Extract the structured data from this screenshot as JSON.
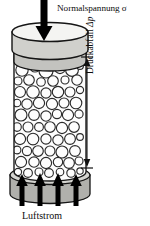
{
  "figure": {
    "labels": {
      "normal_stress": "Normalspannung σ",
      "pressure_drop_text": "Druckabfall ",
      "pressure_drop_symbol": "Δp",
      "airflow": "Luftstrom"
    },
    "colors": {
      "outline": "#1a1a1a",
      "arrow_fill": "#000000",
      "cap_face": "#f2f2f0",
      "cap_side": "#cfcfcb",
      "plate_side": "#b5b5b0",
      "base_disk": "#b0b0ac",
      "base_disk_top": "#d6d6d2",
      "column_body": "#fbfbfb",
      "particle_fill": "#fdfdfd",
      "particle_stroke": "#2b2b2b",
      "background": "#ffffff"
    },
    "geometry": {
      "column_left": 14,
      "column_right": 86,
      "column_top": 33,
      "column_bottom": 180,
      "dimension_line_x": 87,
      "dimension_top_y": 57,
      "dimension_bottom_y": 168
    },
    "icons": {
      "load_arrow": "arrow-down-icon",
      "airflow_arrows": "arrow-up-icon",
      "dimension_arrow": "double-headed-arrow-icon"
    },
    "airflow_arrow_count": 4,
    "particles": [
      {
        "cx": 22,
        "cy": 70,
        "r": 6.2
      },
      {
        "cx": 35,
        "cy": 67,
        "r": 5.0
      },
      {
        "cx": 46,
        "cy": 71,
        "r": 7.0
      },
      {
        "cx": 60,
        "cy": 68,
        "r": 5.6
      },
      {
        "cx": 72,
        "cy": 70,
        "r": 6.4
      },
      {
        "cx": 80,
        "cy": 66,
        "r": 3.4
      },
      {
        "cx": 18,
        "cy": 81,
        "r": 4.0
      },
      {
        "cx": 29,
        "cy": 80,
        "r": 5.3
      },
      {
        "cx": 41,
        "cy": 82,
        "r": 4.3
      },
      {
        "cx": 53,
        "cy": 81,
        "r": 5.3
      },
      {
        "cx": 65,
        "cy": 80,
        "r": 4.0
      },
      {
        "cx": 77,
        "cy": 80,
        "r": 5.2
      },
      {
        "cx": 20,
        "cy": 92,
        "r": 5.5
      },
      {
        "cx": 33,
        "cy": 92,
        "r": 6.3
      },
      {
        "cx": 46,
        "cy": 93,
        "r": 5.1
      },
      {
        "cx": 58,
        "cy": 92,
        "r": 5.7
      },
      {
        "cx": 70,
        "cy": 92,
        "r": 5.0
      },
      {
        "cx": 80,
        "cy": 90,
        "r": 3.6
      },
      {
        "cx": 17,
        "cy": 103,
        "r": 3.8
      },
      {
        "cx": 27,
        "cy": 104,
        "r": 5.2
      },
      {
        "cx": 39,
        "cy": 103,
        "r": 5.6
      },
      {
        "cx": 52,
        "cy": 104,
        "r": 5.6
      },
      {
        "cx": 64,
        "cy": 103,
        "r": 5.0
      },
      {
        "cx": 76,
        "cy": 103,
        "r": 5.8
      },
      {
        "cx": 21,
        "cy": 115,
        "r": 6.0
      },
      {
        "cx": 34,
        "cy": 115,
        "r": 5.4
      },
      {
        "cx": 46,
        "cy": 116,
        "r": 5.2
      },
      {
        "cx": 57,
        "cy": 114,
        "r": 4.6
      },
      {
        "cx": 68,
        "cy": 115,
        "r": 5.6
      },
      {
        "cx": 79,
        "cy": 114,
        "r": 4.1
      },
      {
        "cx": 17,
        "cy": 127,
        "r": 4.3
      },
      {
        "cx": 28,
        "cy": 127,
        "r": 5.0
      },
      {
        "cx": 39,
        "cy": 127,
        "r": 4.4
      },
      {
        "cx": 50,
        "cy": 127,
        "r": 5.3
      },
      {
        "cx": 62,
        "cy": 128,
        "r": 5.6
      },
      {
        "cx": 74,
        "cy": 127,
        "r": 5.3
      },
      {
        "cx": 20,
        "cy": 139,
        "r": 5.6
      },
      {
        "cx": 33,
        "cy": 139,
        "r": 5.8
      },
      {
        "cx": 46,
        "cy": 139,
        "r": 5.1
      },
      {
        "cx": 58,
        "cy": 140,
        "r": 5.2
      },
      {
        "cx": 70,
        "cy": 139,
        "r": 5.4
      },
      {
        "cx": 80,
        "cy": 137,
        "r": 3.4
      },
      {
        "cx": 17,
        "cy": 150,
        "r": 3.9
      },
      {
        "cx": 27,
        "cy": 151,
        "r": 4.6
      },
      {
        "cx": 38,
        "cy": 151,
        "r": 5.3
      },
      {
        "cx": 50,
        "cy": 151,
        "r": 5.0
      },
      {
        "cx": 62,
        "cy": 152,
        "r": 6.0
      },
      {
        "cx": 75,
        "cy": 151,
        "r": 5.4
      },
      {
        "cx": 21,
        "cy": 162,
        "r": 5.6
      },
      {
        "cx": 34,
        "cy": 162,
        "r": 5.2
      },
      {
        "cx": 46,
        "cy": 163,
        "r": 5.6
      },
      {
        "cx": 58,
        "cy": 162,
        "r": 4.7
      },
      {
        "cx": 69,
        "cy": 163,
        "r": 5.4
      },
      {
        "cx": 79,
        "cy": 161,
        "r": 4.0
      },
      {
        "cx": 18,
        "cy": 172,
        "r": 3.6
      },
      {
        "cx": 28,
        "cy": 173,
        "r": 4.4
      },
      {
        "cx": 39,
        "cy": 172,
        "r": 4.0
      },
      {
        "cx": 49,
        "cy": 173,
        "r": 4.4
      },
      {
        "cx": 60,
        "cy": 172,
        "r": 3.8
      },
      {
        "cx": 71,
        "cy": 173,
        "r": 4.2
      },
      {
        "cx": 80,
        "cy": 171,
        "r": 3.2
      }
    ]
  }
}
